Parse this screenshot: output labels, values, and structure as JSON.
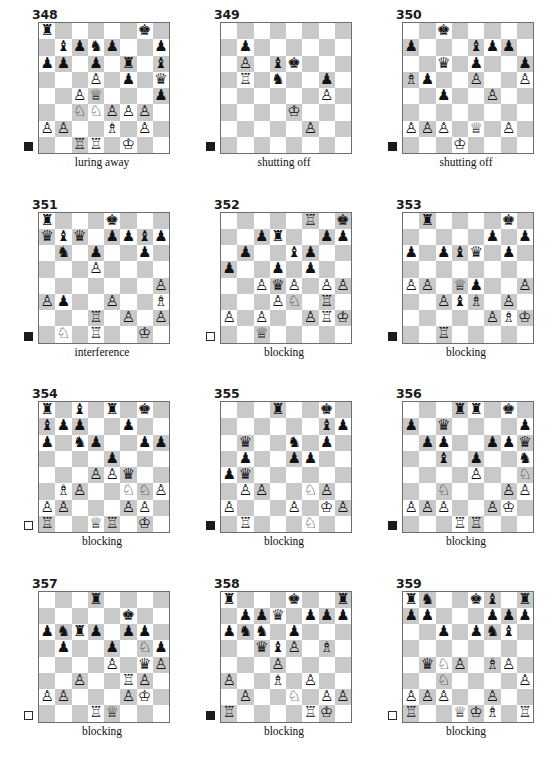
{
  "page": {
    "columns": 3,
    "rows": 4,
    "colors": {
      "light_square": "#ffffff",
      "dark_square": "#c9c9c9",
      "board_border": "#6e6e6e",
      "piece": "#111111",
      "indicator_black": "#1b1b1b",
      "indicator_white": "#ffffff"
    },
    "glyphs": {
      "wK": "♔",
      "wQ": "♕",
      "wR": "♖",
      "wB": "♗",
      "wN": "♘",
      "wP": "♙",
      "bK": "♚",
      "bQ": "♛",
      "bR": "♜",
      "bB": "♝",
      "bN": "♞",
      "bP": "♟"
    }
  },
  "puzzles": [
    {
      "number": "348",
      "caption": "luring away",
      "side_to_move": "black",
      "ranks": [
        [
          "bR",
          "",
          "",
          "",
          "",
          "",
          "bK",
          ""
        ],
        [
          "",
          "bB",
          "bP",
          "bN",
          "bP",
          "",
          "",
          "bP"
        ],
        [
          "bP",
          "bP",
          "",
          "bP",
          "",
          "bR",
          "",
          "bB"
        ],
        [
          "",
          "",
          "",
          "wP",
          "",
          "bP",
          "",
          "bQ"
        ],
        [
          "",
          "",
          "wP",
          "wQ",
          "",
          "",
          "",
          "bP"
        ],
        [
          "",
          "",
          "wN",
          "wN",
          "wP",
          "wP",
          "wP",
          ""
        ],
        [
          "wP",
          "wP",
          "",
          "",
          "wB",
          "",
          "wP",
          ""
        ],
        [
          "",
          "",
          "wR",
          "wR",
          "",
          "wK",
          "",
          ""
        ]
      ]
    },
    {
      "number": "349",
      "caption": "shutting off",
      "side_to_move": "black",
      "ranks": [
        [
          "",
          "",
          "",
          "",
          "",
          "",
          "",
          ""
        ],
        [
          "",
          "bP",
          "",
          "",
          "",
          "",
          "",
          ""
        ],
        [
          "",
          "wP",
          "",
          "bB",
          "bK",
          "",
          "",
          ""
        ],
        [
          "",
          "wR",
          "",
          "bN",
          "",
          "",
          "bP",
          ""
        ],
        [
          "",
          "",
          "",
          "",
          "",
          "",
          "wP",
          ""
        ],
        [
          "",
          "",
          "",
          "",
          "wK",
          "",
          "",
          ""
        ],
        [
          "",
          "",
          "",
          "",
          "",
          "wP",
          "",
          ""
        ],
        [
          "",
          "",
          "",
          "",
          "",
          "",
          "",
          ""
        ]
      ]
    },
    {
      "number": "350",
      "caption": "shutting off",
      "side_to_move": "black",
      "ranks": [
        [
          "",
          "",
          "bK",
          "",
          "",
          "",
          "",
          ""
        ],
        [
          "bP",
          "",
          "",
          "",
          "bB",
          "bP",
          "bP",
          ""
        ],
        [
          "",
          "",
          "bQ",
          "",
          "bP",
          "",
          "",
          "bP"
        ],
        [
          "wB",
          "bP",
          "",
          "",
          "wP",
          "",
          "",
          "wP"
        ],
        [
          "",
          "",
          "bP",
          "",
          "",
          "wP",
          "",
          ""
        ],
        [
          "",
          "",
          "",
          "",
          "",
          "",
          "",
          ""
        ],
        [
          "wP",
          "wP",
          "wP",
          "",
          "wQ",
          "",
          "wP",
          ""
        ],
        [
          "",
          "",
          "",
          "wK",
          "",
          "",
          "",
          ""
        ]
      ]
    },
    {
      "number": "351",
      "caption": "interference",
      "side_to_move": "black",
      "ranks": [
        [
          "bR",
          "",
          "",
          "",
          "bK",
          "",
          "",
          ""
        ],
        [
          "bQ",
          "bB",
          "bQ",
          "",
          "bP",
          "bP",
          "bB",
          "bP"
        ],
        [
          "",
          "bN",
          "",
          "bP",
          "",
          "",
          "bP",
          ""
        ],
        [
          "",
          "",
          "",
          "wP",
          "",
          "",
          "",
          ""
        ],
        [
          "",
          "",
          "",
          "",
          "",
          "",
          "",
          "wP"
        ],
        [
          "wP",
          "bP",
          "",
          "",
          "wP",
          "",
          "",
          "wB"
        ],
        [
          "",
          "",
          "",
          "wR",
          "",
          "wP",
          "",
          "wP"
        ],
        [
          "",
          "wN",
          "",
          "wR",
          "",
          "",
          "wK",
          ""
        ]
      ]
    },
    {
      "number": "352",
      "caption": "blocking",
      "side_to_move": "white",
      "ranks": [
        [
          "",
          "",
          "",
          "",
          "",
          "wR",
          "",
          "bK"
        ],
        [
          "",
          "",
          "bP",
          "bR",
          "",
          "",
          "bP",
          "bP"
        ],
        [
          "",
          "bP",
          "",
          "",
          "bB",
          "bP",
          "",
          ""
        ],
        [
          "bP",
          "",
          "",
          "bP",
          "",
          "bP",
          "",
          ""
        ],
        [
          "",
          "",
          "wP",
          "bQ",
          "wP",
          "",
          "wP",
          "wP"
        ],
        [
          "",
          "",
          "",
          "wP",
          "wN",
          "",
          "wR",
          ""
        ],
        [
          "wP",
          "",
          "wP",
          "",
          "",
          "wP",
          "wR",
          "wK"
        ],
        [
          "",
          "",
          "wQ",
          "",
          "",
          "",
          "",
          ""
        ]
      ]
    },
    {
      "number": "353",
      "caption": "blocking",
      "side_to_move": "black",
      "ranks": [
        [
          "",
          "bR",
          "",
          "",
          "",
          "",
          "bK",
          ""
        ],
        [
          "",
          "",
          "",
          "",
          "",
          "bP",
          "",
          "bP"
        ],
        [
          "bP",
          "",
          "bP",
          "bB",
          "bQ",
          "",
          "bP",
          ""
        ],
        [
          "",
          "",
          "",
          "",
          "",
          "",
          "",
          ""
        ],
        [
          "wP",
          "wP",
          "",
          "wQ",
          "bP",
          "",
          "",
          "wP"
        ],
        [
          "",
          "",
          "wP",
          "bB",
          "wB",
          "",
          "wP",
          ""
        ],
        [
          "",
          "",
          "",
          "",
          "",
          "wP",
          "wB",
          "wK"
        ],
        [
          "",
          "",
          "wR",
          "",
          "",
          "",
          "",
          ""
        ]
      ]
    },
    {
      "number": "354",
      "caption": "blocking",
      "side_to_move": "white",
      "ranks": [
        [
          "bR",
          "",
          "bB",
          "",
          "bR",
          "",
          "bK",
          ""
        ],
        [
          "bB",
          "bP",
          "bP",
          "",
          "",
          "bP",
          "",
          ""
        ],
        [
          "bP",
          "",
          "bN",
          "bP",
          "",
          "",
          "bP",
          "bP"
        ],
        [
          "",
          "",
          "",
          "",
          "bP",
          "",
          "",
          ""
        ],
        [
          "",
          "",
          "",
          "wP",
          "wP",
          "bQ",
          "",
          ""
        ],
        [
          "",
          "wB",
          "wP",
          "",
          "",
          "wN",
          "wN",
          "wP"
        ],
        [
          "wP",
          "wP",
          "",
          "",
          "",
          "wP",
          "wP",
          ""
        ],
        [
          "wR",
          "",
          "",
          "wQ",
          "wR",
          "",
          "wK",
          ""
        ]
      ]
    },
    {
      "number": "355",
      "caption": "blocking",
      "side_to_move": "black",
      "ranks": [
        [
          "",
          "",
          "",
          "bR",
          "",
          "",
          "bK",
          ""
        ],
        [
          "",
          "",
          "",
          "",
          "",
          "",
          "bB",
          "bP"
        ],
        [
          "",
          "bQ",
          "",
          "",
          "bN",
          "",
          "bP",
          ""
        ],
        [
          "",
          "bP",
          "",
          "",
          "bP",
          "bP",
          "",
          ""
        ],
        [
          "bP",
          "bQ",
          "",
          "",
          "",
          "",
          "",
          ""
        ],
        [
          "",
          "wP",
          "wP",
          "",
          "",
          "wN",
          "wP",
          ""
        ],
        [
          "wP",
          "",
          "",
          "",
          "wP",
          "",
          "wK",
          "wP"
        ],
        [
          "",
          "wR",
          "",
          "",
          "",
          "wN",
          "",
          ""
        ]
      ]
    },
    {
      "number": "356",
      "caption": "blocking",
      "side_to_move": "black",
      "ranks": [
        [
          "",
          "",
          "",
          "bR",
          "bR",
          "",
          "bK",
          ""
        ],
        [
          "bP",
          "",
          "bQ",
          "",
          "",
          "",
          "",
          "bP"
        ],
        [
          "",
          "bP",
          "bP",
          "",
          "",
          "bP",
          "bP",
          "bQ"
        ],
        [
          "",
          "",
          "bB",
          "",
          "bP",
          "",
          "",
          "bN"
        ],
        [
          "",
          "",
          "",
          "",
          "wP",
          "",
          "",
          "wN"
        ],
        [
          "",
          "",
          "wN",
          "",
          "",
          "",
          "wP",
          "wP"
        ],
        [
          "wP",
          "wP",
          "wP",
          "",
          "",
          "wP",
          "wK",
          ""
        ],
        [
          "",
          "",
          "",
          "wR",
          "wR",
          "",
          "",
          ""
        ]
      ]
    },
    {
      "number": "357",
      "caption": "blocking",
      "side_to_move": "white",
      "ranks": [
        [
          "",
          "",
          "",
          "bR",
          "",
          "",
          "",
          ""
        ],
        [
          "",
          "",
          "",
          "",
          "",
          "bK",
          "",
          ""
        ],
        [
          "bP",
          "bN",
          "bR",
          "bP",
          "",
          "bP",
          "bP",
          ""
        ],
        [
          "",
          "bP",
          "",
          "",
          "bP",
          "",
          "wN",
          "bP"
        ],
        [
          "",
          "",
          "",
          "",
          "wP",
          "",
          "bQ",
          "wP"
        ],
        [
          "",
          "",
          "wP",
          "",
          "",
          "wR",
          "wP",
          ""
        ],
        [
          "wP",
          "wP",
          "",
          "",
          "",
          "wP",
          "wK",
          ""
        ],
        [
          "",
          "",
          "",
          "wR",
          "wQ",
          "",
          "",
          ""
        ]
      ]
    },
    {
      "number": "358",
      "caption": "blocking",
      "side_to_move": "black",
      "ranks": [
        [
          "bR",
          "",
          "",
          "",
          "bK",
          "",
          "",
          "bR"
        ],
        [
          "",
          "bP",
          "bP",
          "bQ",
          "",
          "bP",
          "bP",
          "bP"
        ],
        [
          "bP",
          "bN",
          "bN",
          "",
          "bP",
          "",
          "",
          ""
        ],
        [
          "",
          "",
          "bQ",
          "bB",
          "wP",
          "",
          "wB",
          ""
        ],
        [
          "",
          "",
          "",
          "wP",
          "",
          "",
          "",
          ""
        ],
        [
          "wP",
          "",
          "",
          "wB",
          "",
          "wP",
          "",
          ""
        ],
        [
          "",
          "wP",
          "",
          "",
          "wN",
          "",
          "wP",
          "wP"
        ],
        [
          "wR",
          "",
          "",
          "",
          "",
          "wR",
          "wK",
          ""
        ]
      ]
    },
    {
      "number": "359",
      "caption": "blocking",
      "side_to_move": "white",
      "ranks": [
        [
          "bR",
          "bN",
          "",
          "",
          "bK",
          "bB",
          "",
          "bR"
        ],
        [
          "bP",
          "bP",
          "",
          "",
          "",
          "bP",
          "bP",
          "bP"
        ],
        [
          "",
          "",
          "bP",
          "",
          "bP",
          "bN",
          "bB",
          ""
        ],
        [
          "",
          "",
          "",
          "",
          "",
          "",
          "",
          ""
        ],
        [
          "",
          "bQ",
          "wN",
          "wP",
          "",
          "wB",
          "wP",
          ""
        ],
        [
          "",
          "",
          "wN",
          "",
          "",
          "",
          "",
          "wP"
        ],
        [
          "wP",
          "wP",
          "wP",
          "",
          "",
          "wP",
          "",
          ""
        ],
        [
          "wR",
          "",
          "",
          "wQ",
          "wK",
          "wB",
          "",
          "wR"
        ]
      ]
    }
  ]
}
